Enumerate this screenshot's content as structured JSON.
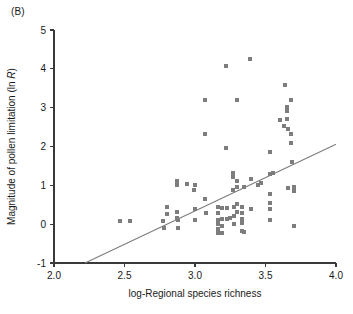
{
  "panel": {
    "label": "(B)"
  },
  "chart_data": {
    "type": "scatter",
    "title": "",
    "panel_label": "(B)",
    "xlabel": "log-Regional species richness",
    "ylabel": "Magnitude of pollen limitation (ln R)",
    "ylabel_plain": "Magnitude of pollen limitation (ln ",
    "ylabel_italic": "R",
    "ylabel_tail": ")",
    "xlim": [
      2.0,
      4.0
    ],
    "ylim": [
      -1,
      5
    ],
    "xticks": [
      2.0,
      2.5,
      3.0,
      3.5,
      4.0
    ],
    "xtick_labels": [
      "2.0",
      "2.5",
      "3.0",
      "3.5",
      "4.0"
    ],
    "yticks": [
      -1,
      0,
      1,
      2,
      3,
      4,
      5
    ],
    "ytick_labels": [
      "-1",
      "0",
      "1",
      "2",
      "3",
      "4",
      "5"
    ],
    "grid": false,
    "legend": null,
    "marker": {
      "shape": "square",
      "size_px": 4,
      "color": "#7d7d7d"
    },
    "fit_line": {
      "type": "linear-regression",
      "color": "#7d7d7d",
      "x_start": 2.22,
      "y_start": -1.0,
      "x_end": 4.0,
      "y_end": 2.06
    },
    "points": [
      [
        2.47,
        0.09
      ],
      [
        2.54,
        0.08
      ],
      [
        2.77,
        0.07
      ],
      [
        2.78,
        -0.1
      ],
      [
        2.8,
        0.44
      ],
      [
        2.8,
        0.25
      ],
      [
        2.87,
        1.1
      ],
      [
        2.87,
        1.02
      ],
      [
        2.87,
        0.32
      ],
      [
        2.87,
        0.15
      ],
      [
        2.88,
        0.12
      ],
      [
        2.88,
        -0.09
      ],
      [
        2.94,
        1.04
      ],
      [
        2.99,
        0.88
      ],
      [
        3.0,
        1.02
      ],
      [
        3.0,
        0.38
      ],
      [
        3.0,
        0.12
      ],
      [
        3.07,
        3.2
      ],
      [
        3.07,
        2.33
      ],
      [
        3.07,
        0.64
      ],
      [
        3.08,
        0.3
      ],
      [
        3.16,
        0.44
      ],
      [
        3.16,
        0.28
      ],
      [
        3.16,
        0.12
      ],
      [
        3.16,
        0.0
      ],
      [
        3.16,
        -0.12
      ],
      [
        3.16,
        -0.22
      ],
      [
        3.19,
        0.41
      ],
      [
        3.19,
        0.14
      ],
      [
        3.19,
        -0.05
      ],
      [
        3.19,
        -0.22
      ],
      [
        3.22,
        4.07
      ],
      [
        3.22,
        1.97
      ],
      [
        3.23,
        0.41
      ],
      [
        3.23,
        0.14
      ],
      [
        3.25,
        0.17
      ],
      [
        3.27,
        1.33
      ],
      [
        3.27,
        1.21
      ],
      [
        3.27,
        0.88
      ],
      [
        3.28,
        0.44
      ],
      [
        3.28,
        0.22
      ],
      [
        3.28,
        0.0
      ],
      [
        3.3,
        3.2
      ],
      [
        3.3,
        1.12
      ],
      [
        3.3,
        0.96
      ],
      [
        3.3,
        0.51
      ],
      [
        3.3,
        0.32
      ],
      [
        3.33,
        0.44
      ],
      [
        3.33,
        0.28
      ],
      [
        3.33,
        0.14
      ],
      [
        3.33,
        0.02
      ],
      [
        3.33,
        -0.18
      ],
      [
        3.35,
        0.96
      ],
      [
        3.35,
        -0.19
      ],
      [
        3.39,
        4.25
      ],
      [
        3.4,
        1.17
      ],
      [
        3.4,
        0.39
      ],
      [
        3.45,
        1.02
      ],
      [
        3.47,
        1.06
      ],
      [
        3.53,
        1.87
      ],
      [
        3.53,
        1.3
      ],
      [
        3.53,
        0.78
      ],
      [
        3.53,
        0.54
      ],
      [
        3.53,
        0.38
      ],
      [
        3.53,
        0.12
      ],
      [
        3.55,
        1.31
      ],
      [
        3.6,
        2.67
      ],
      [
        3.63,
        2.52
      ],
      [
        3.64,
        3.59
      ],
      [
        3.65,
        3.02
      ],
      [
        3.65,
        2.92
      ],
      [
        3.65,
        2.72
      ],
      [
        3.66,
        2.44
      ],
      [
        3.66,
        0.93
      ],
      [
        3.68,
        3.2
      ],
      [
        3.68,
        2.33
      ],
      [
        3.68,
        2.09
      ],
      [
        3.69,
        1.6
      ],
      [
        3.7,
        0.95
      ],
      [
        3.7,
        0.86
      ],
      [
        3.7,
        -0.04
      ]
    ]
  }
}
